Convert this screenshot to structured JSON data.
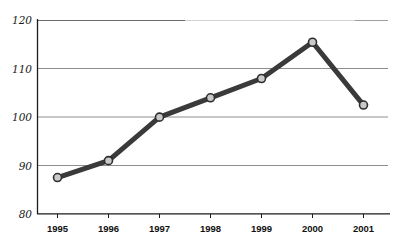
{
  "chart_data": {
    "type": "line",
    "title": "",
    "subtitle": "",
    "xlabel": "",
    "ylabel": "",
    "categories": [
      "1995",
      "1996",
      "1997",
      "1998",
      "1999",
      "2000",
      "2001"
    ],
    "values": [
      87.5,
      91,
      100,
      104,
      108,
      115.5,
      102.5
    ],
    "series": [
      {
        "name": "index",
        "values": [
          87.5,
          91,
          100,
          104,
          108,
          115.5,
          102.5
        ]
      }
    ],
    "ylim": [
      80,
      120
    ],
    "yticks": [
      80,
      90,
      100,
      110,
      120
    ],
    "ytick_labels": [
      "80",
      "90",
      "100",
      "110",
      "120"
    ],
    "xticks": [
      "1995",
      "1996",
      "1997",
      "1998",
      "1999",
      "2000",
      "2001"
    ],
    "grid": "horizontal",
    "legend": "none",
    "annotations": [],
    "style": {
      "line_color": "#3a3a3a",
      "line_width": 5,
      "marker_fill": "#c9c9c9",
      "marker_edge": "#2e2e2e",
      "marker_size": 4,
      "grid_color": "#8e8e8e",
      "axis_color": "#1b1b1b",
      "background": "#ffffff"
    }
  },
  "axes": {
    "y_labels": [
      "120",
      "110",
      "100",
      "90",
      "80"
    ],
    "x_labels": [
      "1995",
      "1996",
      "1997",
      "1998",
      "1999",
      "2000",
      "2001"
    ]
  },
  "points": [
    {
      "year": "1995",
      "value": "87.5"
    },
    {
      "year": "1996",
      "value": "91"
    },
    {
      "year": "1997",
      "value": "100"
    },
    {
      "year": "1998",
      "value": "104"
    },
    {
      "year": "1999",
      "value": "108"
    },
    {
      "year": "2000",
      "value": "115.5"
    },
    {
      "year": "2001",
      "value": "102.5"
    }
  ]
}
